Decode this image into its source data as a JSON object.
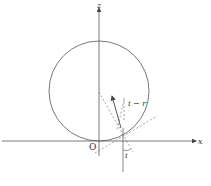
{
  "diagram": {
    "type": "geometry",
    "labels": {
      "z_axis": "z",
      "x_axis": "x",
      "origin": "O",
      "angle_i_minus_r": "i − r",
      "angle_i": "i"
    },
    "colors": {
      "line": "#555555",
      "background": "#ffffff"
    }
  }
}
